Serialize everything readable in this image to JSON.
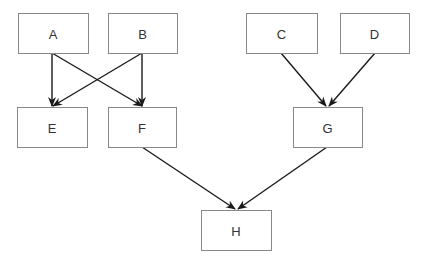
{
  "diagram": {
    "type": "directed-graph",
    "colors": {
      "box_border": "#888888",
      "edge": "#1a1a1a",
      "text": "#333333",
      "background": "#ffffff"
    },
    "nodes": [
      {
        "id": "A",
        "label": "A",
        "x": 18,
        "y": 13,
        "w": 70,
        "h": 40
      },
      {
        "id": "B",
        "label": "B",
        "x": 108,
        "y": 13,
        "w": 69,
        "h": 40
      },
      {
        "id": "C",
        "label": "C",
        "x": 246,
        "y": 13,
        "w": 71,
        "h": 40
      },
      {
        "id": "D",
        "label": "D",
        "x": 340,
        "y": 13,
        "w": 69,
        "h": 40
      },
      {
        "id": "E",
        "label": "E",
        "x": 17,
        "y": 107,
        "w": 70,
        "h": 40
      },
      {
        "id": "F",
        "label": "F",
        "x": 108,
        "y": 107,
        "w": 68,
        "h": 40
      },
      {
        "id": "G",
        "label": "G",
        "x": 293,
        "y": 107,
        "w": 69,
        "h": 40
      },
      {
        "id": "H",
        "label": "H",
        "x": 201,
        "y": 210,
        "w": 70,
        "h": 40
      }
    ],
    "edges": [
      {
        "from": "A",
        "to": "E",
        "x1": 52,
        "y1": 53,
        "x2": 52,
        "y2": 106
      },
      {
        "from": "A",
        "to": "F",
        "x1": 52,
        "y1": 53,
        "x2": 142,
        "y2": 106
      },
      {
        "from": "B",
        "to": "E",
        "x1": 142,
        "y1": 53,
        "x2": 53,
        "y2": 106
      },
      {
        "from": "B",
        "to": "F",
        "x1": 142,
        "y1": 53,
        "x2": 142,
        "y2": 106
      },
      {
        "from": "C",
        "to": "G",
        "x1": 281,
        "y1": 53,
        "x2": 326,
        "y2": 106
      },
      {
        "from": "D",
        "to": "G",
        "x1": 375,
        "y1": 53,
        "x2": 329,
        "y2": 106
      },
      {
        "from": "F",
        "to": "H",
        "x1": 142,
        "y1": 147,
        "x2": 235,
        "y2": 209
      },
      {
        "from": "G",
        "to": "H",
        "x1": 327,
        "y1": 147,
        "x2": 238,
        "y2": 209
      }
    ]
  }
}
